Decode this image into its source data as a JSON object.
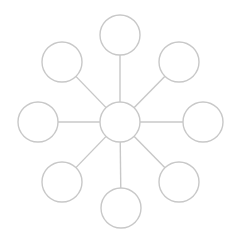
{
  "diagram": {
    "type": "hub-and-spoke",
    "width": 239,
    "height": 243,
    "background": "#ffffff",
    "stroke_color": "#c8c8c8",
    "stroke_width": 1.4,
    "node_fill": "#ffffff",
    "hub": {
      "id": "center",
      "cx": 120,
      "cy": 122,
      "r": 20,
      "label": ""
    },
    "nodes": [
      {
        "id": "top",
        "cx": 120,
        "cy": 35,
        "r": 20,
        "label": ""
      },
      {
        "id": "top-right",
        "cx": 179,
        "cy": 62,
        "r": 20,
        "label": ""
      },
      {
        "id": "right",
        "cx": 203,
        "cy": 122,
        "r": 20,
        "label": ""
      },
      {
        "id": "bottom-right",
        "cx": 179,
        "cy": 182,
        "r": 20,
        "label": ""
      },
      {
        "id": "bottom",
        "cx": 121,
        "cy": 208,
        "r": 20,
        "label": ""
      },
      {
        "id": "bottom-left",
        "cx": 62,
        "cy": 182,
        "r": 20,
        "label": ""
      },
      {
        "id": "left",
        "cx": 38,
        "cy": 122,
        "r": 20,
        "label": ""
      },
      {
        "id": "top-left",
        "cx": 62,
        "cy": 62,
        "r": 20,
        "label": ""
      }
    ]
  }
}
